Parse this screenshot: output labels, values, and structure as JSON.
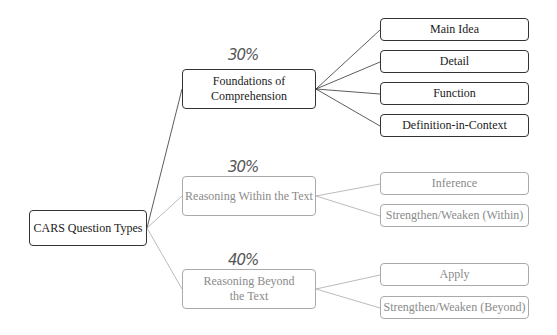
{
  "diagram": {
    "root": {
      "label": "CARS Question Types"
    },
    "branches": [
      {
        "label": "Foundations of Comprehension",
        "percent": "30%",
        "style": "dark",
        "children": [
          "Main Idea",
          "Detail",
          "Function",
          "Definition-in-Context"
        ]
      },
      {
        "label": "Reasoning Within the Text",
        "percent": "30%",
        "style": "light",
        "children": [
          "Inference",
          "Strengthen/Weaken (Within)"
        ]
      },
      {
        "label": "Reasoning Beyond the Text",
        "percent": "40%",
        "style": "light",
        "children": [
          "Apply",
          "Strengthen/Weaken (Beyond)"
        ]
      }
    ],
    "colors": {
      "dark_stroke": "#333333",
      "light_stroke": "#aaaaaa",
      "light_text": "#8a8a8a"
    }
  }
}
